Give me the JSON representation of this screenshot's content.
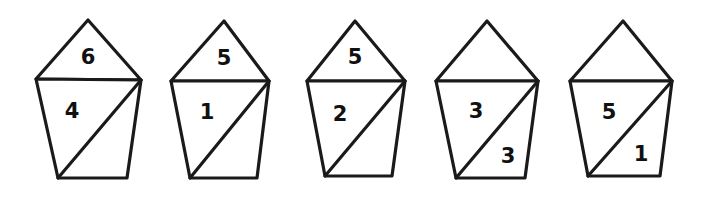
{
  "figure": {
    "background_color": "#ffffff",
    "stroke_color": "#1a1a1a",
    "label_color": "#111111",
    "shape_count": 5,
    "shapes": [
      {
        "id": "shape-1",
        "name": "house-figure-1",
        "triangle": {
          "apex": [
            88,
            20
          ],
          "left": [
            36,
            79
          ],
          "right": [
            141,
            80
          ],
          "label": "6",
          "label_pos": [
            88,
            58
          ]
        },
        "body": {
          "top_left": [
            36,
            79
          ],
          "top_right": [
            141,
            80
          ],
          "bottom_right": [
            127,
            178
          ],
          "bottom_left": [
            58,
            178
          ],
          "diagonal_from": [
            141,
            80
          ],
          "diagonal_to": [
            58,
            178
          ],
          "upper_label": "4",
          "upper_label_pos": [
            72,
            112
          ],
          "lower_label": "",
          "lower_label_pos": [
            112,
            155
          ]
        }
      },
      {
        "id": "shape-2",
        "name": "house-figure-2",
        "triangle": {
          "apex": [
            224,
            21
          ],
          "left": [
            171,
            81
          ],
          "right": [
            269,
            81
          ],
          "label": "5",
          "label_pos": [
            224,
            59
          ]
        },
        "body": {
          "top_left": [
            171,
            81
          ],
          "top_right": [
            269,
            81
          ],
          "bottom_right": [
            257,
            178
          ],
          "bottom_left": [
            190,
            178
          ],
          "diagonal_from": [
            269,
            81
          ],
          "diagonal_to": [
            190,
            178
          ],
          "upper_label": "1",
          "upper_label_pos": [
            207,
            113
          ],
          "lower_label": "",
          "lower_label_pos": [
            241,
            155
          ]
        }
      },
      {
        "id": "shape-3",
        "name": "house-figure-3",
        "triangle": {
          "apex": [
            355,
            21
          ],
          "left": [
            307,
            81
          ],
          "right": [
            405,
            81
          ],
          "label": "5",
          "label_pos": [
            355,
            58
          ]
        },
        "body": {
          "top_left": [
            307,
            81
          ],
          "top_right": [
            405,
            81
          ],
          "bottom_right": [
            392,
            176
          ],
          "bottom_left": [
            325,
            176
          ],
          "diagonal_from": [
            405,
            81
          ],
          "diagonal_to": [
            325,
            176
          ],
          "upper_label": "2",
          "upper_label_pos": [
            340,
            115
          ],
          "lower_label": "",
          "lower_label_pos": [
            378,
            154
          ]
        }
      },
      {
        "id": "shape-4",
        "name": "house-figure-4",
        "triangle": {
          "apex": [
            487,
            21
          ],
          "left": [
            436,
            81
          ],
          "right": [
            538,
            81
          ],
          "label": "",
          "label_pos": [
            487,
            58
          ]
        },
        "body": {
          "top_left": [
            436,
            81
          ],
          "top_right": [
            538,
            81
          ],
          "bottom_right": [
            525,
            178
          ],
          "bottom_left": [
            456,
            178
          ],
          "diagonal_from": [
            538,
            81
          ],
          "diagonal_to": [
            456,
            178
          ],
          "upper_label": "3",
          "upper_label_pos": [
            476,
            112
          ],
          "lower_label": "3",
          "lower_label_pos": [
            508,
            157
          ]
        }
      },
      {
        "id": "shape-5",
        "name": "house-figure-5",
        "triangle": {
          "apex": [
            623,
            21
          ],
          "left": [
            570,
            81
          ],
          "right": [
            672,
            81
          ],
          "label": "",
          "label_pos": [
            623,
            58
          ]
        },
        "body": {
          "top_left": [
            570,
            81
          ],
          "top_right": [
            672,
            81
          ],
          "bottom_right": [
            660,
            176
          ],
          "bottom_left": [
            588,
            176
          ],
          "diagonal_from": [
            672,
            81
          ],
          "diagonal_to": [
            588,
            176
          ],
          "upper_label": "5",
          "upper_label_pos": [
            609,
            113
          ],
          "lower_label": "1",
          "lower_label_pos": [
            641,
            155
          ]
        }
      }
    ]
  }
}
